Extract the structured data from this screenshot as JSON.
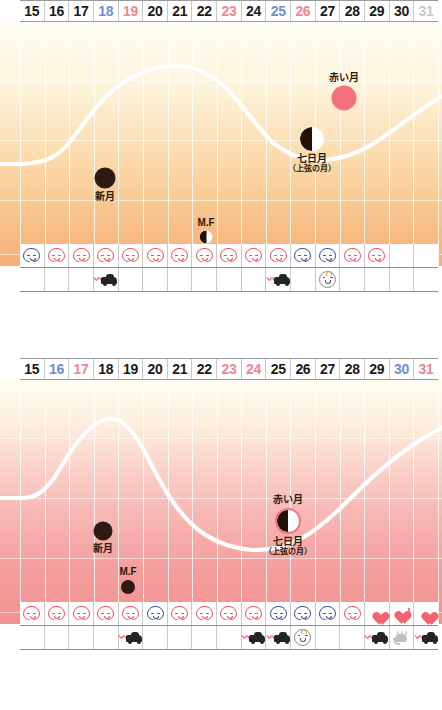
{
  "page": {
    "width": 442,
    "height": 710,
    "background": "#ffffff"
  },
  "palette": {
    "day_black": "#1a1a1a",
    "day_blue": "#6b8fd4",
    "day_red": "#ef8790",
    "day_gray": "#c8c8c8",
    "curve": "#ffffff",
    "grid": "rgba(255,255,255,0.8)",
    "face_red": "#ef4b57",
    "face_navy": "#3b4a8f",
    "heart": "#f0636f",
    "red_moon": "#f4707e",
    "new_moon": "#2e1a12",
    "chart1_top": "#fffdf4",
    "chart1_bottom": "#f6b079",
    "chart2_top": "#fffdf2",
    "chart2_bottom": "#f2918f"
  },
  "charts": [
    {
      "id": "chart-1",
      "days": [
        {
          "label": "15",
          "color": "black"
        },
        {
          "label": "16",
          "color": "black"
        },
        {
          "label": "17",
          "color": "black"
        },
        {
          "label": "18",
          "color": "blue"
        },
        {
          "label": "19",
          "color": "red"
        },
        {
          "label": "20",
          "color": "black"
        },
        {
          "label": "21",
          "color": "black"
        },
        {
          "label": "22",
          "color": "black"
        },
        {
          "label": "23",
          "color": "red"
        },
        {
          "label": "24",
          "color": "black"
        },
        {
          "label": "25",
          "color": "blue"
        },
        {
          "label": "26",
          "color": "red"
        },
        {
          "label": "27",
          "color": "black"
        },
        {
          "label": "28",
          "color": "black"
        },
        {
          "label": "29",
          "color": "black"
        },
        {
          "label": "30",
          "color": "black"
        },
        {
          "label": "31",
          "color": "gray"
        }
      ],
      "markers": [
        {
          "name": "new-moon-marker",
          "phase": "new",
          "label_l1": "新月",
          "label_l2": "",
          "label_pos": "below",
          "size": 21,
          "x_day": 19.1,
          "y_pct": 64
        },
        {
          "name": "mf-moon-marker",
          "phase": "half",
          "label_l1": "M.F",
          "label_l2": "",
          "label_pos": "above",
          "size": 13,
          "x_day": 22.0,
          "y_pct": 88
        },
        {
          "name": "seventh-day-moon-marker",
          "phase": "half",
          "label_l1": "七日月",
          "label_l2": "（上弦の月）",
          "label_pos": "below",
          "size": 24,
          "x_day": 27.0,
          "y_pct": 48
        },
        {
          "name": "red-moon-marker",
          "phase": "red",
          "label_l1": "赤い月",
          "label_l2": "",
          "label_pos": "above",
          "size": 25,
          "x_day": 28.2,
          "y_pct": 31
        }
      ],
      "icon_row_faces": [
        {
          "icon": "face-icon",
          "tone": "navy"
        },
        {
          "icon": "face-icon",
          "tone": "red"
        },
        {
          "icon": "face-icon",
          "tone": "red"
        },
        {
          "icon": "face-icon",
          "tone": "red"
        },
        {
          "icon": "face-icon",
          "tone": "red"
        },
        {
          "icon": "face-icon",
          "tone": "red"
        },
        {
          "icon": "face-icon",
          "tone": "red"
        },
        {
          "icon": "face-icon",
          "tone": "red"
        },
        {
          "icon": "face-icon",
          "tone": "red"
        },
        {
          "icon": "face-icon",
          "tone": "red"
        },
        {
          "icon": "face-icon",
          "tone": "red"
        },
        {
          "icon": "face-icon",
          "tone": "navy"
        },
        {
          "icon": "face-icon",
          "tone": "navy"
        },
        {
          "icon": "face-icon",
          "tone": "red"
        },
        {
          "icon": "face-icon",
          "tone": "red"
        },
        {
          "icon": "none",
          "tone": ""
        },
        {
          "icon": "none",
          "tone": ""
        }
      ],
      "icon_row_events": [
        {
          "icon": "none"
        },
        {
          "icon": "none"
        },
        {
          "icon": "none"
        },
        {
          "icon": "car-icon"
        },
        {
          "icon": "none"
        },
        {
          "icon": "none"
        },
        {
          "icon": "none"
        },
        {
          "icon": "none"
        },
        {
          "icon": "none"
        },
        {
          "icon": "none"
        },
        {
          "icon": "car-icon"
        },
        {
          "icon": "none"
        },
        {
          "icon": "baby-icon"
        },
        {
          "icon": "none"
        },
        {
          "icon": "none"
        },
        {
          "icon": "none"
        },
        {
          "icon": "none"
        }
      ]
    },
    {
      "id": "chart-2",
      "days": [
        {
          "label": "15",
          "color": "black"
        },
        {
          "label": "16",
          "color": "blue"
        },
        {
          "label": "17",
          "color": "red"
        },
        {
          "label": "18",
          "color": "black"
        },
        {
          "label": "19",
          "color": "black"
        },
        {
          "label": "20",
          "color": "black"
        },
        {
          "label": "21",
          "color": "black"
        },
        {
          "label": "22",
          "color": "black"
        },
        {
          "label": "23",
          "color": "red"
        },
        {
          "label": "24",
          "color": "red"
        },
        {
          "label": "25",
          "color": "black"
        },
        {
          "label": "26",
          "color": "black"
        },
        {
          "label": "27",
          "color": "black"
        },
        {
          "label": "28",
          "color": "black"
        },
        {
          "label": "29",
          "color": "black"
        },
        {
          "label": "30",
          "color": "blue"
        },
        {
          "label": "31",
          "color": "red"
        }
      ],
      "markers": [
        {
          "name": "new-moon-marker",
          "phase": "new",
          "label_l1": "新月",
          "label_l2": "",
          "label_pos": "below",
          "size": 19,
          "x_day": 19.0,
          "y_pct": 62
        },
        {
          "name": "mf-moon-marker",
          "phase": "new",
          "label_l1": "M.F",
          "label_l2": "",
          "label_pos": "above",
          "size": 14,
          "x_day": 20.6,
          "y_pct": 85
        },
        {
          "name": "red-seventh-moon-marker",
          "phase": "half-ring",
          "label_l1": "七日月",
          "label_l2": "（上弦の月）",
          "label_pos": "below",
          "size": 26,
          "x_day": 25.9,
          "y_pct": 58,
          "label_above": "赤い月"
        }
      ],
      "icon_row_faces": [
        {
          "icon": "face-icon",
          "tone": "red"
        },
        {
          "icon": "face-icon",
          "tone": "red"
        },
        {
          "icon": "face-icon",
          "tone": "red"
        },
        {
          "icon": "face-icon",
          "tone": "red"
        },
        {
          "icon": "face-icon",
          "tone": "red"
        },
        {
          "icon": "face-icon",
          "tone": "navy"
        },
        {
          "icon": "face-icon",
          "tone": "red"
        },
        {
          "icon": "face-icon",
          "tone": "red"
        },
        {
          "icon": "face-icon",
          "tone": "red"
        },
        {
          "icon": "face-icon",
          "tone": "red"
        },
        {
          "icon": "face-icon",
          "tone": "navy"
        },
        {
          "icon": "face-icon",
          "tone": "navy"
        },
        {
          "icon": "face-icon",
          "tone": "navy"
        },
        {
          "icon": "face-icon",
          "tone": "red"
        },
        {
          "icon": "heart-icon",
          "tone": ""
        },
        {
          "icon": "heart-bang-icon",
          "tone": ""
        },
        {
          "icon": "heart-icon",
          "tone": ""
        }
      ],
      "icon_row_events": [
        {
          "icon": "none"
        },
        {
          "icon": "none"
        },
        {
          "icon": "none"
        },
        {
          "icon": "none"
        },
        {
          "icon": "car-icon"
        },
        {
          "icon": "none"
        },
        {
          "icon": "none"
        },
        {
          "icon": "none"
        },
        {
          "icon": "none"
        },
        {
          "icon": "car-icon"
        },
        {
          "icon": "car-icon"
        },
        {
          "icon": "baby-icon"
        },
        {
          "icon": "none"
        },
        {
          "icon": "none"
        },
        {
          "icon": "car-icon"
        },
        {
          "icon": "splash-icon"
        },
        {
          "icon": "car-icon"
        }
      ]
    }
  ],
  "chart_data": [
    {
      "type": "line",
      "title": "",
      "xlabel": "",
      "ylabel": "",
      "x": [
        15,
        16,
        17,
        18,
        19,
        20,
        21,
        22,
        23,
        24,
        25,
        26,
        27,
        28,
        29,
        30,
        31
      ],
      "values": [
        42,
        42,
        42,
        48,
        66,
        80,
        86,
        86,
        80,
        68,
        56,
        50,
        50,
        54,
        62,
        70,
        76
      ],
      "ylim": [
        0,
        100
      ],
      "grid": true,
      "legend": "none",
      "series_color": "#ffffff",
      "annotations": [
        "新月",
        "M.F",
        "七日月（上弦の月）",
        "赤い月"
      ]
    },
    {
      "type": "line",
      "title": "",
      "xlabel": "",
      "ylabel": "",
      "x": [
        15,
        16,
        17,
        18,
        19,
        20,
        21,
        22,
        23,
        24,
        25,
        26,
        27,
        28,
        29,
        30,
        31
      ],
      "values": [
        42,
        44,
        60,
        86,
        92,
        80,
        64,
        52,
        44,
        38,
        34,
        33,
        35,
        40,
        48,
        58,
        70
      ],
      "ylim": [
        0,
        100
      ],
      "grid": true,
      "legend": "none",
      "series_color": "#ffffff",
      "annotations": [
        "新月",
        "M.F",
        "赤い月",
        "七日月（上弦の月）"
      ]
    }
  ]
}
